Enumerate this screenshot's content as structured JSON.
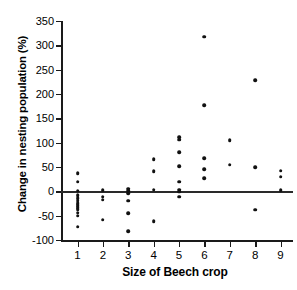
{
  "chart_data": {
    "type": "scatter",
    "title": "",
    "xlabel": "Size of Beech crop",
    "ylabel": "Change in nesting population (%)",
    "xlim": [
      0.35,
      9.45
    ],
    "ylim": [
      -100,
      350
    ],
    "yticks": [
      -100,
      -50,
      0,
      50,
      100,
      150,
      200,
      250,
      300,
      350
    ],
    "ytick_labels": [
      "-100",
      "-50",
      "0",
      "50",
      "100",
      "150",
      "200",
      "250",
      "300",
      "350"
    ],
    "xticks": [
      1,
      2,
      3,
      4,
      5,
      6,
      7,
      8,
      9
    ],
    "xtick_labels": [
      "1",
      "2",
      "3",
      "4",
      "5",
      "6",
      "7",
      "8",
      "9"
    ],
    "grid": false,
    "legend": null,
    "reference_lines": [
      {
        "axis": "y",
        "value": 0
      }
    ],
    "marker": "filled-circle",
    "marker_color": "#111111",
    "points": [
      {
        "x": 1,
        "y": 37
      },
      {
        "x": 1,
        "y": 20
      },
      {
        "x": 1,
        "y": 1
      },
      {
        "x": 1,
        "y": -8
      },
      {
        "x": 1,
        "y": -14
      },
      {
        "x": 1,
        "y": -19
      },
      {
        "x": 1,
        "y": -24
      },
      {
        "x": 1,
        "y": -28
      },
      {
        "x": 1,
        "y": -32
      },
      {
        "x": 1,
        "y": -37
      },
      {
        "x": 1,
        "y": -44
      },
      {
        "x": 1,
        "y": -50
      },
      {
        "x": 1,
        "y": -73
      },
      {
        "x": 2,
        "y": 2
      },
      {
        "x": 2,
        "y": -11
      },
      {
        "x": 2,
        "y": -17
      },
      {
        "x": 2,
        "y": -58
      },
      {
        "x": 3,
        "y": 5
      },
      {
        "x": 3,
        "y": 1
      },
      {
        "x": 3,
        "y": -4
      },
      {
        "x": 3,
        "y": -19
      },
      {
        "x": 3,
        "y": -45
      },
      {
        "x": 3,
        "y": -82
      },
      {
        "x": 4,
        "y": 66
      },
      {
        "x": 4,
        "y": 41
      },
      {
        "x": 4,
        "y": 3
      },
      {
        "x": 4,
        "y": -61
      },
      {
        "x": 5,
        "y": 111
      },
      {
        "x": 5,
        "y": 106
      },
      {
        "x": 5,
        "y": 81
      },
      {
        "x": 5,
        "y": 52
      },
      {
        "x": 5,
        "y": 20
      },
      {
        "x": 5,
        "y": 3
      },
      {
        "x": 5,
        "y": -1
      },
      {
        "x": 5,
        "y": -11
      },
      {
        "x": 6,
        "y": 318
      },
      {
        "x": 6,
        "y": 177
      },
      {
        "x": 6,
        "y": 68
      },
      {
        "x": 6,
        "y": 45
      },
      {
        "x": 6,
        "y": 27
      },
      {
        "x": 7,
        "y": 105
      },
      {
        "x": 7,
        "y": 55
      },
      {
        "x": 8,
        "y": 228
      },
      {
        "x": 8,
        "y": 50
      },
      {
        "x": 8,
        "y": -38
      },
      {
        "x": 9,
        "y": 42
      },
      {
        "x": 9,
        "y": 30
      },
      {
        "x": 9,
        "y": 2
      }
    ]
  }
}
